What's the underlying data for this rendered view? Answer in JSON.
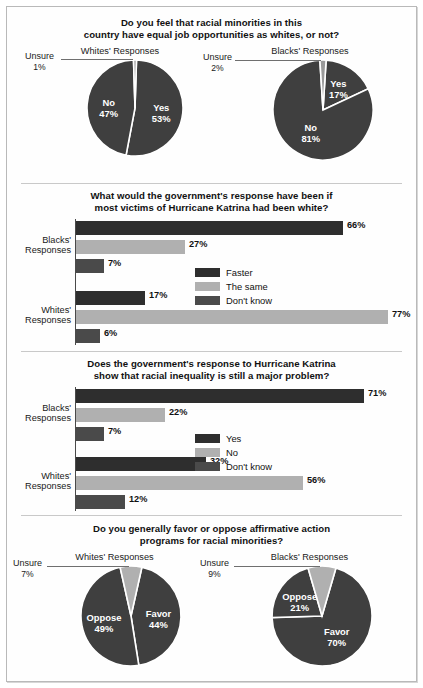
{
  "colors": {
    "dark": "#3f3f3f",
    "darkest": "#2e2e2e",
    "light": "#b0b0b0",
    "mid": "#4a4a4a",
    "sliver": "#9a9a9a",
    "text": "#1a1a1a",
    "frame": "#b9b9b9"
  },
  "panels": [
    {
      "id": "equal-job-opportunities",
      "title_line1": "Do you feel that racial minorities in this",
      "title_line2": "country have equal job opportunities as whites, or not?",
      "charts": [
        {
          "caption": "Whites' Responses",
          "slices": [
            {
              "label": "Yes",
              "value": 53,
              "value_text": "53%",
              "color": "#3f3f3f",
              "inside": true
            },
            {
              "label": "No",
              "value": 47,
              "value_text": "47%",
              "color": "#3f3f3f",
              "inside": true
            },
            {
              "label": "Unsure",
              "value": 1,
              "value_text": "1%",
              "color": "#9a9a9a",
              "inside": false
            }
          ]
        },
        {
          "caption": "Blacks' Responses",
          "slices": [
            {
              "label": "Yes",
              "value": 17,
              "value_text": "17%",
              "color": "#3f3f3f",
              "inside": true
            },
            {
              "label": "No",
              "value": 81,
              "value_text": "81%",
              "color": "#3f3f3f",
              "inside": true
            },
            {
              "label": "Unsure",
              "value": 2,
              "value_text": "2%",
              "color": "#9a9a9a",
              "inside": false
            }
          ]
        }
      ]
    },
    {
      "id": "katrina-response-if-white",
      "title_line1": "What would the government's response have been if",
      "title_line2": "most victims of Hurricane Katrina had been white?",
      "legend": [
        {
          "label": "Faster",
          "color": "#2e2e2e"
        },
        {
          "label": "The same",
          "color": "#b0b0b0"
        },
        {
          "label": "Don't know",
          "color": "#4a4a4a"
        }
      ],
      "groups": [
        {
          "label_line1": "Blacks'",
          "label_line2": "Responses",
          "bars": [
            {
              "series": "Faster",
              "value": 66,
              "value_text": "66%",
              "color": "#2e2e2e"
            },
            {
              "series": "The same",
              "value": 27,
              "value_text": "27%",
              "color": "#b0b0b0"
            },
            {
              "series": "Don't know",
              "value": 7,
              "value_text": "7%",
              "color": "#4a4a4a"
            }
          ]
        },
        {
          "label_line1": "Whites'",
          "label_line2": "Responses",
          "bars": [
            {
              "series": "Faster",
              "value": 17,
              "value_text": "17%",
              "color": "#2e2e2e"
            },
            {
              "series": "The same",
              "value": 77,
              "value_text": "77%",
              "color": "#b0b0b0"
            },
            {
              "series": "Don't know",
              "value": 6,
              "value_text": "6%",
              "color": "#4a4a4a"
            }
          ]
        }
      ]
    },
    {
      "id": "katrina-racial-inequality",
      "title_line1": "Does the government's response to Hurricane Katrina",
      "title_line2": "show that racial inequality is still a major problem?",
      "legend": [
        {
          "label": "Yes",
          "color": "#2e2e2e"
        },
        {
          "label": "No",
          "color": "#b0b0b0"
        },
        {
          "label": "Don't know",
          "color": "#4a4a4a"
        }
      ],
      "groups": [
        {
          "label_line1": "Blacks'",
          "label_line2": "Responses",
          "bars": [
            {
              "series": "Yes",
              "value": 71,
              "value_text": "71%",
              "color": "#2e2e2e"
            },
            {
              "series": "No",
              "value": 22,
              "value_text": "22%",
              "color": "#b0b0b0"
            },
            {
              "series": "Don't know",
              "value": 7,
              "value_text": "7%",
              "color": "#4a4a4a"
            }
          ]
        },
        {
          "label_line1": "Whites'",
          "label_line2": "Responses",
          "bars": [
            {
              "series": "Yes",
              "value": 32,
              "value_text": "32%",
              "color": "#2e2e2e"
            },
            {
              "series": "No",
              "value": 56,
              "value_text": "56%",
              "color": "#b0b0b0"
            },
            {
              "series": "Don't know",
              "value": 12,
              "value_text": "12%",
              "color": "#4a4a4a"
            }
          ]
        }
      ]
    },
    {
      "id": "affirmative-action",
      "title_line1": "Do you generally favor or oppose affirmative action",
      "title_line2": "programs for racial minorities?",
      "charts": [
        {
          "caption": "Whites' Responses",
          "slices": [
            {
              "label": "Favor",
              "value": 44,
              "value_text": "44%",
              "color": "#3f3f3f",
              "inside": true
            },
            {
              "label": "Oppose",
              "value": 49,
              "value_text": "49%",
              "color": "#3f3f3f",
              "inside": true
            },
            {
              "label": "Unsure",
              "value": 7,
              "value_text": "7%",
              "color": "#b0b0b0",
              "inside": false
            }
          ]
        },
        {
          "caption": "Blacks' Responses",
          "slices": [
            {
              "label": "Favor",
              "value": 70,
              "value_text": "70%",
              "color": "#3f3f3f",
              "inside": true
            },
            {
              "label": "Oppose",
              "value": 21,
              "value_text": "21%",
              "color": "#3f3f3f",
              "inside": true
            },
            {
              "label": "Unsure",
              "value": 9,
              "value_text": "9%",
              "color": "#b0b0b0",
              "inside": false
            }
          ]
        }
      ]
    }
  ],
  "chart_data": [
    {
      "type": "pie",
      "title": "Do you feel that racial minorities in this country have equal job opportunities as whites, or not?",
      "subtitle": "Whites' Responses",
      "labels": [
        "Yes",
        "No",
        "Unsure"
      ],
      "values": [
        53,
        47,
        1
      ],
      "legend_position": "inline-labels"
    },
    {
      "type": "pie",
      "title": "Do you feel that racial minorities in this country have equal job opportunities as whites, or not?",
      "subtitle": "Blacks' Responses",
      "labels": [
        "Yes",
        "No",
        "Unsure"
      ],
      "values": [
        17,
        81,
        2
      ],
      "legend_position": "inline-labels"
    },
    {
      "type": "bar",
      "title": "What would the government's response have been if most victims of Hurricane Katrina had been white?",
      "orientation": "horizontal",
      "categories": [
        "Blacks' Responses",
        "Whites' Responses"
      ],
      "series": [
        {
          "name": "Faster",
          "values": [
            66,
            17
          ]
        },
        {
          "name": "The same",
          "values": [
            27,
            77
          ]
        },
        {
          "name": "Don't know",
          "values": [
            7,
            6
          ]
        }
      ],
      "xlabel": "",
      "ylabel": "",
      "xlim": [
        0,
        100
      ],
      "grid": false,
      "legend_position": "center-right"
    },
    {
      "type": "bar",
      "title": "Does the government's response to Hurricane Katrina show that racial inequality is still a major problem?",
      "orientation": "horizontal",
      "categories": [
        "Blacks' Responses",
        "Whites' Responses"
      ],
      "series": [
        {
          "name": "Yes",
          "values": [
            71,
            32
          ]
        },
        {
          "name": "No",
          "values": [
            22,
            56
          ]
        },
        {
          "name": "Don't know",
          "values": [
            7,
            12
          ]
        }
      ],
      "xlabel": "",
      "ylabel": "",
      "xlim": [
        0,
        100
      ],
      "grid": false,
      "legend_position": "center-right"
    },
    {
      "type": "pie",
      "title": "Do you generally favor or oppose affirmative action programs for racial minorities?",
      "subtitle": "Whites' Responses",
      "labels": [
        "Favor",
        "Oppose",
        "Unsure"
      ],
      "values": [
        44,
        49,
        7
      ],
      "legend_position": "inline-labels"
    },
    {
      "type": "pie",
      "title": "Do you generally favor or oppose affirmative action programs for racial minorities?",
      "subtitle": "Blacks' Responses",
      "labels": [
        "Favor",
        "Oppose",
        "Unsure"
      ],
      "values": [
        70,
        21,
        9
      ],
      "legend_position": "inline-labels"
    }
  ]
}
